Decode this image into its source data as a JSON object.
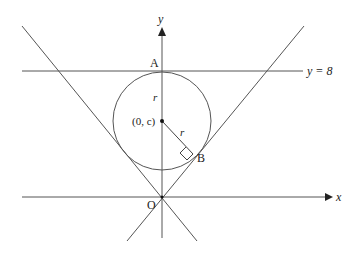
{
  "diagram": {
    "axes": {
      "x_label": "x",
      "y_label": "y",
      "origin_label": "O"
    },
    "horizontal_line_label": "y = 8",
    "point_a_label": "A",
    "point_b_label": "B",
    "center_label": "(0, c)",
    "radius_label_vertical": "r",
    "radius_label_diagonal": "r",
    "colors": {
      "line": "#555555",
      "text": "#222222"
    }
  }
}
